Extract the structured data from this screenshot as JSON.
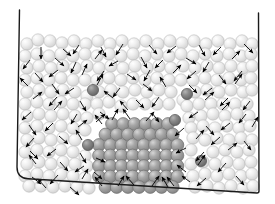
{
  "figure": {
    "background_color": "#ffffff"
  },
  "container": {
    "name": "simulation-box",
    "stroke_color": "#1a1a1a",
    "stroke_width": 1.4,
    "open_top": true,
    "left_wall": {
      "x1": 19.5,
      "y1": 10.0,
      "x2": 17.0,
      "y2": 178.0
    },
    "bottom_wall": {
      "x1": 17.0,
      "y1": 178.0,
      "x2": 259.0,
      "y2": 193.0
    },
    "right_wall": {
      "x1": 258.5,
      "y1": 13.0,
      "x2": 259.0,
      "y2": 193.0
    },
    "bottom_left_corner_radius": 11,
    "bottom_right_corner_radius": 2
  },
  "particles": {
    "fluid": {
      "label": "fluid-particle",
      "fill": "#e2e2e2",
      "highlight": "#fdfdfd",
      "edge": "#b9b9b9",
      "radius": 6.2,
      "count": 188
    },
    "crystal": {
      "label": "crystal-particle",
      "fill": "#9a9a9a",
      "highlight": "#cfcfcf",
      "edge": "#6e6e6e",
      "radius": 6.4,
      "rows": [
        {
          "y": 124.0,
          "x_start": 112.0,
          "n": 6
        },
        {
          "y": 134.5,
          "x_start": 105.5,
          "n": 7
        },
        {
          "y": 145.0,
          "x_start": 99.0,
          "n": 8
        },
        {
          "y": 155.5,
          "x_start": 99.0,
          "n": 8
        },
        {
          "y": 166.0,
          "x_start": 99.0,
          "n": 8
        },
        {
          "y": 176.5,
          "x_start": 99.0,
          "n": 8
        },
        {
          "y": 187.0,
          "x_start": 105.5,
          "n": 7
        }
      ],
      "spacing": 11.2,
      "count": 52
    },
    "impurity": {
      "label": "impurity-particle",
      "fill": "#7b7b7b",
      "highlight": "#a8a8a8",
      "edge": "#565656",
      "radius": 5.6,
      "positions": [
        {
          "x": 93,
          "y": 90
        },
        {
          "x": 187,
          "y": 94
        },
        {
          "x": 175,
          "y": 120
        },
        {
          "x": 88,
          "y": 145
        },
        {
          "x": 201,
          "y": 161
        }
      ],
      "count": 5
    }
  },
  "arrows": {
    "label": "velocity-arrow",
    "color": "#000000",
    "shaft_width": 0.9,
    "head_length": 5.2,
    "head_width": 4.2,
    "count": 72,
    "legend": "Instantaneous particle velocity vectors"
  },
  "fluid_positions": [
    [
      27,
      44
    ],
    [
      38,
      40
    ],
    [
      50,
      41
    ],
    [
      62,
      43
    ],
    [
      74,
      41
    ],
    [
      86,
      44
    ],
    [
      98,
      41
    ],
    [
      110,
      44
    ],
    [
      122,
      41
    ],
    [
      134,
      44
    ],
    [
      146,
      41
    ],
    [
      158,
      44
    ],
    [
      170,
      41
    ],
    [
      182,
      43
    ],
    [
      194,
      41
    ],
    [
      206,
      44
    ],
    [
      218,
      41
    ],
    [
      230,
      44
    ],
    [
      242,
      41
    ],
    [
      252,
      44
    ],
    [
      25,
      56
    ],
    [
      37,
      54
    ],
    [
      49,
      56
    ],
    [
      61,
      54
    ],
    [
      73,
      56
    ],
    [
      85,
      54
    ],
    [
      97,
      56
    ],
    [
      109,
      54
    ],
    [
      121,
      56
    ],
    [
      133,
      54
    ],
    [
      145,
      56
    ],
    [
      157,
      54
    ],
    [
      169,
      56
    ],
    [
      181,
      54
    ],
    [
      193,
      56
    ],
    [
      205,
      54
    ],
    [
      217,
      56
    ],
    [
      229,
      54
    ],
    [
      241,
      56
    ],
    [
      251,
      54
    ],
    [
      27,
      68
    ],
    [
      39,
      66
    ],
    [
      51,
      68
    ],
    [
      63,
      66
    ],
    [
      75,
      68
    ],
    [
      87,
      66
    ],
    [
      99,
      68
    ],
    [
      111,
      66
    ],
    [
      123,
      68
    ],
    [
      135,
      66
    ],
    [
      147,
      68
    ],
    [
      159,
      66
    ],
    [
      171,
      68
    ],
    [
      183,
      66
    ],
    [
      195,
      68
    ],
    [
      207,
      66
    ],
    [
      219,
      68
    ],
    [
      231,
      66
    ],
    [
      243,
      68
    ],
    [
      252,
      66
    ],
    [
      25,
      80
    ],
    [
      37,
      78
    ],
    [
      49,
      80
    ],
    [
      61,
      78
    ],
    [
      73,
      80
    ],
    [
      85,
      80
    ],
    [
      97,
      80
    ],
    [
      109,
      78
    ],
    [
      121,
      80
    ],
    [
      133,
      78
    ],
    [
      145,
      80
    ],
    [
      157,
      78
    ],
    [
      169,
      80
    ],
    [
      181,
      80
    ],
    [
      193,
      80
    ],
    [
      205,
      78
    ],
    [
      217,
      80
    ],
    [
      229,
      78
    ],
    [
      241,
      80
    ],
    [
      251,
      78
    ],
    [
      27,
      92
    ],
    [
      39,
      90
    ],
    [
      51,
      92
    ],
    [
      63,
      90
    ],
    [
      75,
      92
    ],
    [
      87,
      96
    ],
    [
      99,
      92
    ],
    [
      111,
      90
    ],
    [
      123,
      92
    ],
    [
      135,
      90
    ],
    [
      147,
      92
    ],
    [
      159,
      90
    ],
    [
      171,
      92
    ],
    [
      183,
      100
    ],
    [
      195,
      92
    ],
    [
      207,
      90
    ],
    [
      219,
      92
    ],
    [
      231,
      90
    ],
    [
      243,
      92
    ],
    [
      252,
      90
    ],
    [
      25,
      104
    ],
    [
      37,
      102
    ],
    [
      49,
      104
    ],
    [
      61,
      102
    ],
    [
      73,
      104
    ],
    [
      85,
      104
    ],
    [
      97,
      104
    ],
    [
      109,
      102
    ],
    [
      121,
      106
    ],
    [
      133,
      104
    ],
    [
      145,
      104
    ],
    [
      157,
      104
    ],
    [
      169,
      104
    ],
    [
      187,
      106
    ],
    [
      199,
      104
    ],
    [
      211,
      104
    ],
    [
      223,
      104
    ],
    [
      235,
      104
    ],
    [
      247,
      104
    ],
    [
      27,
      116
    ],
    [
      39,
      114
    ],
    [
      51,
      116
    ],
    [
      63,
      114
    ],
    [
      75,
      116
    ],
    [
      87,
      118
    ],
    [
      99,
      114
    ],
    [
      189,
      118
    ],
    [
      201,
      116
    ],
    [
      213,
      114
    ],
    [
      225,
      116
    ],
    [
      237,
      114
    ],
    [
      249,
      116
    ],
    [
      25,
      128
    ],
    [
      37,
      126
    ],
    [
      49,
      128
    ],
    [
      61,
      126
    ],
    [
      73,
      128
    ],
    [
      85,
      130
    ],
    [
      191,
      128
    ],
    [
      203,
      126
    ],
    [
      215,
      128
    ],
    [
      227,
      126
    ],
    [
      239,
      128
    ],
    [
      250,
      126
    ],
    [
      27,
      140
    ],
    [
      39,
      138
    ],
    [
      51,
      140
    ],
    [
      63,
      138
    ],
    [
      75,
      140
    ],
    [
      193,
      138
    ],
    [
      205,
      140
    ],
    [
      217,
      138
    ],
    [
      229,
      140
    ],
    [
      241,
      138
    ],
    [
      252,
      140
    ],
    [
      25,
      152
    ],
    [
      37,
      150
    ],
    [
      49,
      152
    ],
    [
      61,
      150
    ],
    [
      73,
      152
    ],
    [
      85,
      156
    ],
    [
      191,
      150
    ],
    [
      213,
      152
    ],
    [
      225,
      150
    ],
    [
      237,
      152
    ],
    [
      249,
      150
    ],
    [
      27,
      164
    ],
    [
      39,
      162
    ],
    [
      51,
      164
    ],
    [
      63,
      162
    ],
    [
      75,
      164
    ],
    [
      87,
      166
    ],
    [
      191,
      164
    ],
    [
      203,
      162
    ],
    [
      215,
      164
    ],
    [
      227,
      162
    ],
    [
      239,
      164
    ],
    [
      251,
      162
    ],
    [
      25,
      176
    ],
    [
      37,
      174
    ],
    [
      49,
      176
    ],
    [
      61,
      174
    ],
    [
      73,
      176
    ],
    [
      85,
      178
    ],
    [
      193,
      176
    ],
    [
      205,
      174
    ],
    [
      217,
      176
    ],
    [
      229,
      174
    ],
    [
      241,
      176
    ],
    [
      252,
      174
    ],
    [
      29,
      186
    ],
    [
      41,
      186
    ],
    [
      53,
      187
    ],
    [
      65,
      186
    ],
    [
      77,
      187
    ],
    [
      89,
      188
    ],
    [
      195,
      187
    ],
    [
      207,
      186
    ],
    [
      219,
      188
    ],
    [
      231,
      186
    ],
    [
      243,
      188
    ],
    [
      253,
      186
    ]
  ],
  "arrow_vectors": [
    [
      41,
      47,
      0,
      12
    ],
    [
      63,
      49,
      8,
      7
    ],
    [
      79,
      45,
      -6,
      9
    ],
    [
      101,
      47,
      5,
      10
    ],
    [
      123,
      44,
      -7,
      11
    ],
    [
      149,
      45,
      8,
      9
    ],
    [
      176,
      46,
      -9,
      7
    ],
    [
      199,
      45,
      6,
      11
    ],
    [
      221,
      47,
      -8,
      8
    ],
    [
      244,
      44,
      9,
      9
    ],
    [
      30,
      60,
      -7,
      9
    ],
    [
      55,
      58,
      9,
      8
    ],
    [
      76,
      62,
      -5,
      11
    ],
    [
      95,
      59,
      7,
      -9
    ],
    [
      118,
      61,
      -9,
      5
    ],
    [
      141,
      57,
      6,
      11
    ],
    [
      163,
      60,
      -8,
      8
    ],
    [
      186,
      58,
      10,
      6
    ],
    [
      209,
      62,
      -6,
      10
    ],
    [
      232,
      59,
      8,
      -8
    ],
    [
      35,
      73,
      8,
      9
    ],
    [
      58,
      70,
      -9,
      7
    ],
    [
      82,
      75,
      5,
      -11
    ],
    [
      104,
      71,
      -7,
      10
    ],
    [
      127,
      74,
      9,
      6
    ],
    [
      150,
      70,
      -6,
      11
    ],
    [
      173,
      73,
      8,
      -8
    ],
    [
      196,
      71,
      -9,
      8
    ],
    [
      219,
      75,
      7,
      9
    ],
    [
      242,
      71,
      -8,
      10
    ],
    [
      28,
      86,
      -8,
      -8
    ],
    [
      52,
      84,
      7,
      10
    ],
    [
      74,
      88,
      -9,
      6
    ],
    [
      97,
      85,
      6,
      -11
    ],
    [
      120,
      88,
      -7,
      9
    ],
    [
      143,
      84,
      9,
      7
    ],
    [
      166,
      87,
      -6,
      -10
    ],
    [
      189,
      85,
      8,
      8
    ],
    [
      212,
      88,
      -9,
      7
    ],
    [
      235,
      84,
      7,
      -10
    ],
    [
      33,
      99,
      9,
      -7
    ],
    [
      57,
      97,
      -8,
      9
    ],
    [
      80,
      101,
      6,
      10
    ],
    [
      113,
      98,
      -9,
      -7
    ],
    [
      136,
      100,
      8,
      8
    ],
    [
      159,
      97,
      -7,
      10
    ],
    [
      205,
      100,
      9,
      -8
    ],
    [
      228,
      98,
      -8,
      8
    ],
    [
      250,
      101,
      -7,
      9
    ],
    [
      31,
      112,
      -9,
      8
    ],
    [
      54,
      110,
      8,
      -9
    ],
    [
      77,
      114,
      -6,
      10
    ],
    [
      100,
      112,
      9,
      7
    ],
    [
      128,
      110,
      -8,
      -9
    ],
    [
      152,
      113,
      7,
      9
    ],
    [
      198,
      112,
      -9,
      6
    ],
    [
      222,
      110,
      8,
      -8
    ],
    [
      246,
      114,
      -7,
      9
    ],
    [
      29,
      125,
      7,
      10
    ],
    [
      53,
      123,
      -8,
      8
    ],
    [
      78,
      127,
      9,
      -7
    ],
    [
      102,
      124,
      -7,
      -9
    ],
    [
      206,
      126,
      8,
      9
    ],
    [
      230,
      123,
      -9,
      7
    ],
    [
      252,
      127,
      6,
      -10
    ],
    [
      34,
      138,
      -8,
      9
    ],
    [
      59,
      136,
      9,
      8
    ],
    [
      82,
      140,
      -6,
      -10
    ],
    [
      196,
      139,
      8,
      -9
    ],
    [
      220,
      137,
      -9,
      8
    ],
    [
      244,
      141,
      7,
      9
    ],
    [
      30,
      151,
      8,
      8
    ],
    [
      56,
      149,
      -9,
      7
    ],
    [
      80,
      153,
      6,
      10
    ],
    [
      204,
      152,
      -8,
      9
    ],
    [
      228,
      150,
      9,
      -7
    ],
    [
      36,
      164,
      -7,
      -9
    ],
    [
      60,
      162,
      8,
      9
    ],
    [
      84,
      166,
      -9,
      6
    ],
    [
      198,
      165,
      7,
      -10
    ],
    [
      226,
      163,
      -8,
      9
    ],
    [
      32,
      177,
      9,
      7
    ],
    [
      58,
      175,
      -8,
      9
    ],
    [
      82,
      179,
      6,
      -10
    ],
    [
      206,
      178,
      -9,
      8
    ],
    [
      236,
      176,
      8,
      9
    ],
    [
      46,
      188,
      -8,
      -9
    ],
    [
      70,
      187,
      9,
      8
    ],
    [
      102,
      186,
      -7,
      -9
    ],
    [
      118,
      186,
      6,
      -10
    ],
    [
      134,
      185,
      -8,
      -9
    ],
    [
      152,
      186,
      7,
      -10
    ],
    [
      168,
      187,
      -6,
      -10
    ],
    [
      96,
      122,
      9,
      -8
    ],
    [
      112,
      120,
      6,
      -11
    ],
    [
      130,
      119,
      -7,
      -10
    ],
    [
      146,
      121,
      8,
      -9
    ],
    [
      184,
      128,
      -9,
      8
    ],
    [
      186,
      148,
      -10,
      5
    ],
    [
      96,
      158,
      9,
      4
    ],
    [
      94,
      172,
      8,
      7
    ],
    [
      186,
      172,
      -9,
      -7
    ],
    [
      174,
      186,
      -7,
      -9
    ],
    [
      190,
      182,
      -8,
      -6
    ]
  ]
}
